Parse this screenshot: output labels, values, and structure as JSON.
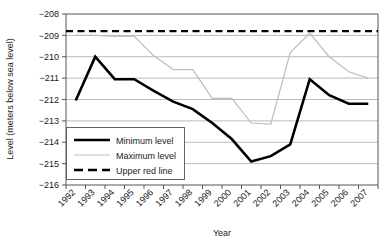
{
  "chart_data": {
    "type": "line",
    "title": "",
    "xlabel": "Year",
    "ylabel": "Level (meters below sea level)",
    "categories": [
      "1992",
      "1993",
      "1994",
      "1995",
      "1996",
      "1997",
      "1998",
      "1999",
      "2000",
      "2001",
      "2002",
      "2003",
      "2004",
      "2005",
      "2006",
      "2007"
    ],
    "ylim": [
      -216,
      -208
    ],
    "yticks": [
      "-208",
      "-209",
      "-210",
      "-211",
      "-212",
      "-213",
      "-214",
      "-215",
      "-216"
    ],
    "ytick_values": [
      -208,
      -209,
      -210,
      -211,
      -212,
      -213,
      -214,
      -215,
      -216
    ],
    "grid": true,
    "legend_position": "inside-lower-left",
    "series": [
      {
        "name": "Minimum level",
        "style": "solid-thick-black",
        "color": "#000000",
        "values": [
          -212.05,
          -210.0,
          -211.05,
          -211.05,
          -211.6,
          -212.1,
          -212.45,
          -213.1,
          -213.85,
          -214.9,
          -214.65,
          -214.1,
          -211.05,
          -211.8,
          -212.2,
          -212.2
        ]
      },
      {
        "name": "Maximum level",
        "style": "solid-thin-gray",
        "color": "#bdbdbd",
        "values": [
          -209.0,
          -209.0,
          -209.05,
          -209.05,
          -209.95,
          -210.6,
          -210.6,
          -211.95,
          -211.95,
          -213.1,
          -213.15,
          -209.8,
          -208.9,
          -210.0,
          -210.7,
          -211.0
        ]
      },
      {
        "name": "Upper red line",
        "style": "dashed-black",
        "color": "#000000",
        "values": [
          -208.8,
          -208.8,
          -208.8,
          -208.8,
          -208.8,
          -208.8,
          -208.8,
          -208.8,
          -208.8,
          -208.8,
          -208.8,
          -208.8,
          -208.8,
          -208.8,
          -208.8,
          -208.8
        ]
      }
    ]
  },
  "legend": {
    "items": [
      {
        "label": "Minimum level"
      },
      {
        "label": "Maximum level"
      },
      {
        "label": "Upper red line"
      }
    ]
  }
}
